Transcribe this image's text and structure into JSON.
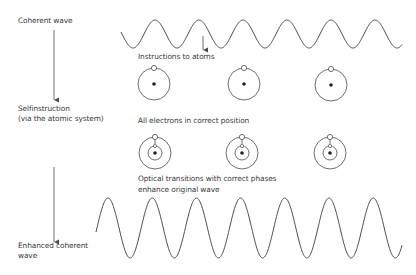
{
  "diagram": {
    "labels": {
      "coherent_wave": "Coherent wave",
      "selfinstruction_1": "Selfinstruction",
      "selfinstruction_2": "(via the atomic system)",
      "enhanced_1": "Enhanced coherent",
      "enhanced_2": "wave",
      "instructions": "Instructions to atoms",
      "all_electrons": "All electrons in correct position",
      "optical_1": "Optical transitions with correct phases",
      "optical_2": "enhance original wave"
    },
    "colors": {
      "line": "#4a4a4a",
      "text": "#3a3a3a",
      "background": "#ffffff"
    },
    "top_wave": {
      "x_start": 121,
      "x_end": 402,
      "center_y": 34,
      "amplitude": 14,
      "period": 44,
      "first_peak_x": 155
    },
    "bottom_wave": {
      "x_start": 96,
      "x_end": 402,
      "center_y": 228,
      "amplitude": 30,
      "period": 44.2,
      "first_peak_x": 108
    },
    "atoms_before": [
      {
        "cx": 154,
        "cy": 84
      },
      {
        "cx": 244,
        "cy": 84
      },
      {
        "cx": 331,
        "cy": 85
      }
    ],
    "atoms_after": [
      {
        "cx": 155,
        "cy": 153
      },
      {
        "cx": 242,
        "cy": 153
      },
      {
        "cx": 330,
        "cy": 153
      }
    ]
  }
}
